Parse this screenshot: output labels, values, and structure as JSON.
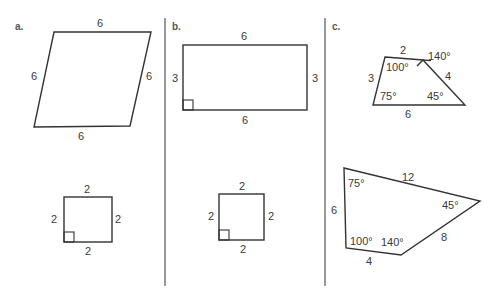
{
  "panels": [
    {
      "label": "a.",
      "figures": [
        {
          "name": "parallelogram",
          "sides": {
            "top": "6",
            "right": "6",
            "bottom": "6",
            "left": "6"
          }
        },
        {
          "name": "square",
          "right_angle": true,
          "sides": {
            "top": "2",
            "right": "2",
            "bottom": "2",
            "left": "2"
          }
        }
      ]
    },
    {
      "label": "b.",
      "figures": [
        {
          "name": "rectangle",
          "right_angle": true,
          "sides": {
            "top": "6",
            "right": "3",
            "bottom": "6",
            "left": "3"
          }
        },
        {
          "name": "square",
          "right_angle": true,
          "sides": {
            "top": "2",
            "right": "2",
            "bottom": "2",
            "left": "2"
          }
        }
      ]
    },
    {
      "label": "c.",
      "figures": [
        {
          "name": "small-quadrilateral",
          "sides": {
            "top": "2",
            "right": "4",
            "bottom": "6",
            "left": "3"
          },
          "angles": {
            "top_left": "100°",
            "top_right_exterior": "140°",
            "bottom_right": "45°",
            "bottom_left": "75°"
          }
        },
        {
          "name": "large-quadrilateral",
          "sides": {
            "top": "12",
            "right": "8",
            "bottom": "4",
            "left": "6"
          },
          "angles": {
            "top_left": "75°",
            "right": "45°",
            "bottom_right": "140°",
            "bottom_left": "100°"
          }
        }
      ]
    }
  ],
  "colors": {
    "stroke": "#333333",
    "text": "#3a3a3a",
    "background": "#ffffff"
  }
}
